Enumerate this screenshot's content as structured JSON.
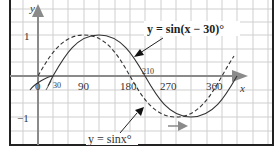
{
  "diagram": {
    "axes": {
      "x_label": "x",
      "y_label": "y",
      "x_ticks": [
        "0",
        "30",
        "90",
        "180",
        "210",
        "270",
        "360"
      ],
      "y_ticks": [
        "1",
        "−1"
      ]
    },
    "curves": [
      {
        "name": "y = sin(x − 30)°",
        "style": "solid",
        "label": "y = sin(x − 30)°"
      },
      {
        "name": "y = sinx°",
        "style": "dashed",
        "label": "y = sinx°"
      }
    ],
    "annotations": {
      "shift_arrow": "translation right by 30°"
    },
    "colors": {
      "grid": "#cfcfcf",
      "axis": "#8a8a8a",
      "frame": "#222222",
      "curve": "#333333",
      "shift_arrow": "#8a8a8a"
    }
  }
}
